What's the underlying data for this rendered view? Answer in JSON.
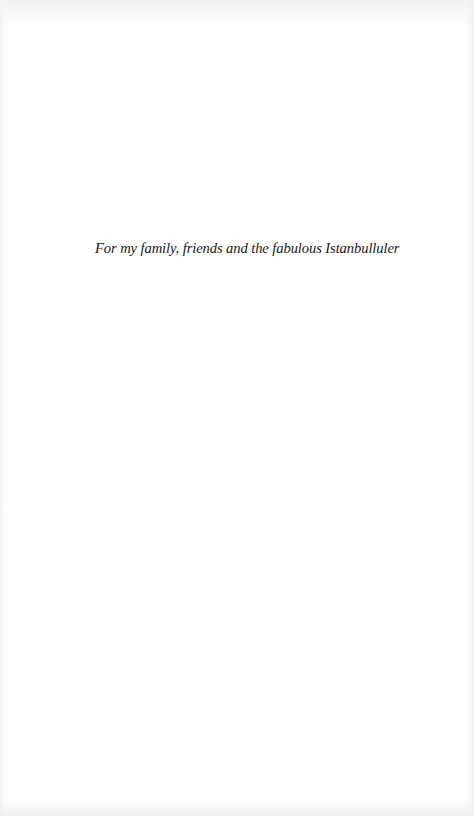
{
  "page": {
    "dedication": "For my family, friends and the fabulous Istanbulluler"
  },
  "colors": {
    "background": "#fefefe",
    "text": "#1a1a1a"
  }
}
